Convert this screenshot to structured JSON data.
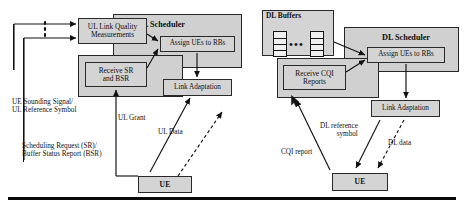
{
  "diagram": {
    "bottom_rule_color": "#0a0a0a"
  },
  "uplink": {
    "panel_title": "UL Scheduler",
    "boxes": {
      "link_quality": "UL Link Quality\nMeasurements",
      "receive_sr_bsr": "Receive SR\nand BSR",
      "assign_ues": "Assign UEs to RBs",
      "link_adaptation": "Link Adaptation",
      "ue": "UE"
    },
    "labels": {
      "sounding": "UE Sounding Signal/\nUL Reference Symbol",
      "scheduling_request": "Scheduling Request (SR)/\nBuffer Status Report (BSR)",
      "ul_grant": "UL Grant",
      "ul_data": "UL Data"
    }
  },
  "downlink": {
    "panel_title": "DL Scheduler",
    "boxes": {
      "dl_buffers": "DL Buffers",
      "receive_cqi": "Receive CQI\nReports",
      "assign_ues": "Assign UEs to RBs",
      "link_adaptation": "Link Adaptation",
      "ue": "UE"
    },
    "labels": {
      "cqi_report": "CQI report",
      "dl_reference": "DL reference\nsymbol",
      "dl_data": "DL data"
    },
    "buffers": {
      "ellipsis": "•••",
      "column_segments": 4
    }
  },
  "colors": {
    "box_fill": "#d4d4d4",
    "panel_fill": "#d0d0d0",
    "stroke": "#1d1d1d",
    "text": "#101010"
  }
}
